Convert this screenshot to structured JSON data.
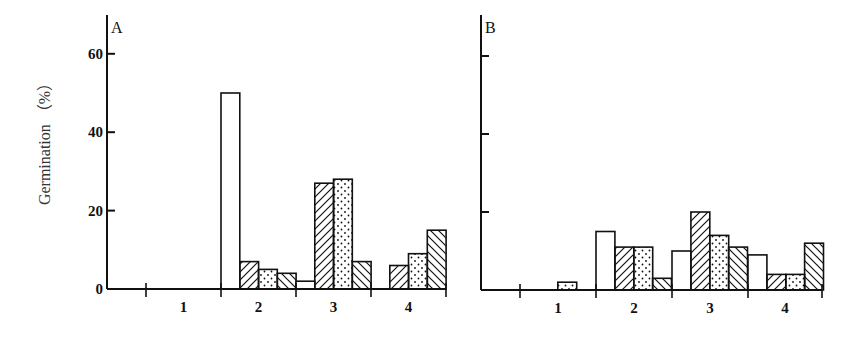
{
  "chart_data": [
    {
      "type": "bar",
      "panel": "A",
      "title": "A",
      "xlabel": "",
      "ylabel": "Germination (%)",
      "ylim": [
        0,
        70
      ],
      "yticks": [
        0,
        20,
        40,
        60
      ],
      "categories": [
        "1",
        "2",
        "3",
        "4"
      ],
      "grid": false,
      "series": [
        {
          "name": "open",
          "pattern": "none",
          "values": [
            0,
            50,
            2,
            0
          ]
        },
        {
          "name": "right-hatched",
          "pattern": "hatch-forward",
          "values": [
            0,
            7,
            27,
            6
          ]
        },
        {
          "name": "dotted",
          "pattern": "dots",
          "values": [
            0,
            5,
            28,
            9
          ]
        },
        {
          "name": "left-hatched",
          "pattern": "hatch-back",
          "values": [
            0,
            4,
            7,
            15
          ]
        }
      ]
    },
    {
      "type": "bar",
      "panel": "B",
      "title": "B",
      "xlabel": "",
      "ylabel": "Germination (%)",
      "ylim": [
        0,
        70
      ],
      "yticks": [
        0,
        20,
        40,
        60
      ],
      "categories": [
        "1",
        "2",
        "3",
        "4"
      ],
      "grid": false,
      "series": [
        {
          "name": "open",
          "pattern": "none",
          "values": [
            0,
            15,
            10,
            9
          ]
        },
        {
          "name": "right-hatched",
          "pattern": "hatch-forward",
          "values": [
            0,
            11,
            20,
            4
          ]
        },
        {
          "name": "dotted",
          "pattern": "dots",
          "values": [
            2,
            11,
            14,
            4
          ]
        },
        {
          "name": "left-hatched",
          "pattern": "hatch-back",
          "values": [
            0,
            3,
            11,
            12
          ]
        }
      ]
    }
  ],
  "labels": {
    "ylabel": "Germination （%）",
    "panelA": "A",
    "panelB": "B",
    "yticks": [
      "0",
      "20",
      "40",
      "60"
    ],
    "xcats": [
      "1",
      "2",
      "3",
      "4"
    ]
  }
}
